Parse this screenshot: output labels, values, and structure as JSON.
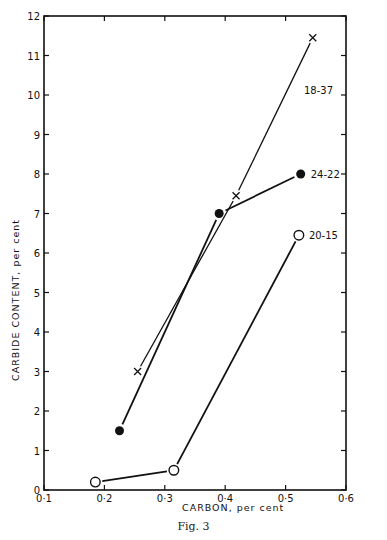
{
  "chart_data": {
    "type": "line",
    "title": "",
    "caption": "Fig. 3",
    "xlabel": "CARBON, per cent",
    "ylabel": "CARBIDE CONTENT, per cent",
    "xlim": [
      0.1,
      0.6
    ],
    "ylim": [
      0,
      12
    ],
    "x_ticks": [
      "0·1",
      "0·2",
      "0·3",
      "0·4",
      "0·5",
      "0·6"
    ],
    "y_ticks": [
      "0",
      "1",
      "2",
      "3",
      "4",
      "5",
      "6",
      "7",
      "8",
      "9",
      "10",
      "11",
      "12"
    ],
    "grid": false,
    "legend": "inline labels near series ends",
    "series": [
      {
        "name": "18-37",
        "marker": "x",
        "points": [
          {
            "x": 0.255,
            "y": 3.0
          },
          {
            "x": 0.418,
            "y": 7.45
          },
          {
            "x": 0.545,
            "y": 11.45
          }
        ]
      },
      {
        "name": "24-22",
        "marker": "filled-circle",
        "points": [
          {
            "x": 0.225,
            "y": 1.5
          },
          {
            "x": 0.39,
            "y": 7.0
          },
          {
            "x": 0.525,
            "y": 8.0
          }
        ]
      },
      {
        "name": "20-15",
        "marker": "open-circle",
        "points": [
          {
            "x": 0.185,
            "y": 0.2
          },
          {
            "x": 0.315,
            "y": 0.5
          },
          {
            "x": 0.522,
            "y": 6.45
          }
        ]
      }
    ]
  }
}
